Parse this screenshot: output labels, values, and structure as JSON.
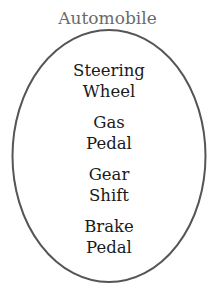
{
  "diagram": {
    "title": "Automobile",
    "container_shape": "ellipse",
    "colors": {
      "outline": "#555555",
      "title": "#6a6a6a",
      "text": "#1a1a1a"
    },
    "items": [
      {
        "line1": "Steering",
        "line2": "Wheel"
      },
      {
        "line1": "Gas",
        "line2": "Pedal"
      },
      {
        "line1": "Gear",
        "line2": "Shift"
      },
      {
        "line1": "Brake",
        "line2": "Pedal"
      }
    ]
  }
}
